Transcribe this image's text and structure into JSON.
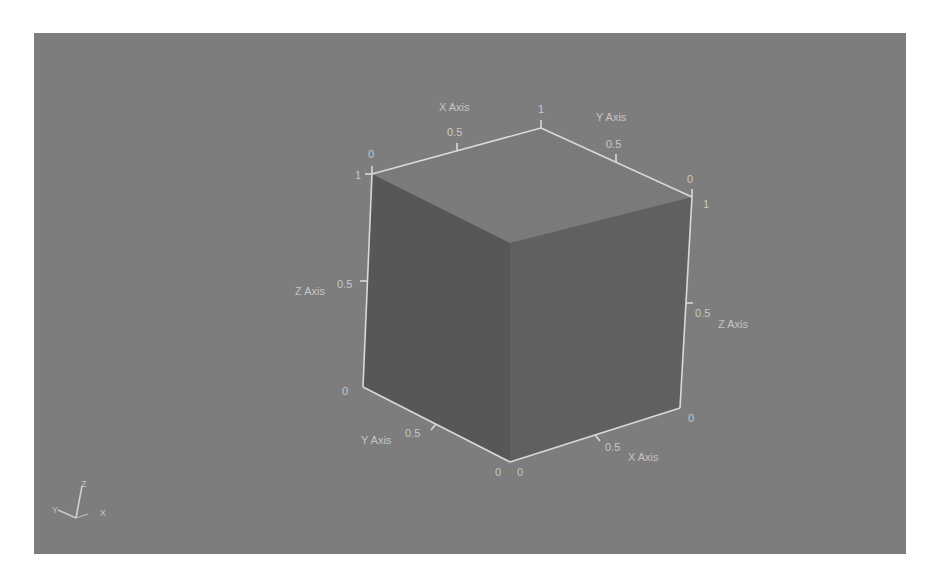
{
  "viewport": {
    "background": "#7d7d7d",
    "face_colors": {
      "top": "#7c7c7c",
      "left": "#5a5a5a",
      "right": "#626262"
    },
    "edge_color": "#d8d8d8"
  },
  "axes": {
    "top_x": {
      "title": "X Axis",
      "ticks": [
        "0",
        "0.5",
        "1"
      ]
    },
    "top_y": {
      "title": "Y Axis",
      "ticks": [
        "0.5",
        "0"
      ]
    },
    "left_z": {
      "title": "Z Axis",
      "ticks": [
        "1",
        "0.5",
        "0"
      ]
    },
    "right_z": {
      "title": "Z Axis",
      "ticks": [
        "1",
        "0.5",
        "0"
      ]
    },
    "bottom_y": {
      "title": "Y Axis",
      "ticks": [
        "0.5",
        "0"
      ]
    },
    "bottom_x": {
      "title": "X Axis",
      "ticks": [
        "0",
        "0.5",
        "0"
      ]
    }
  },
  "orientation_widget": {
    "z_label": "Z",
    "y_label": "Y",
    "x_label": "X"
  }
}
